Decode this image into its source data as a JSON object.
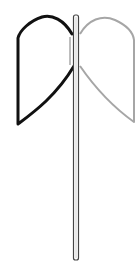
{
  "diagram": {
    "colors": {
      "background": "#ffffff",
      "left_wing_stroke": "#111111",
      "right_wing_stroke": "#a6a6a6",
      "pole_stroke": "#444444",
      "pole_fill": "#ffffff"
    },
    "pole": {
      "x": 73.5,
      "y": 15,
      "width": 5,
      "height": 245
    },
    "left_wing": {
      "stroke_width": 3
    },
    "right_wing": {
      "stroke_width": 2
    }
  }
}
